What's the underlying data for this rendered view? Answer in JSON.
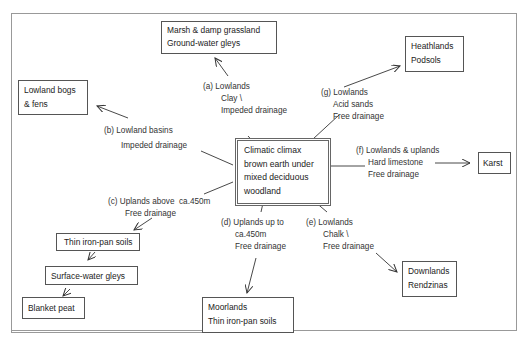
{
  "diagram": {
    "type": "soil-development flow diagram",
    "center": {
      "lines": [
        "Climatic climax",
        "brown earth under",
        "mixed deciduous",
        "woodland"
      ]
    },
    "branches": [
      {
        "id": "a",
        "marker": "(a)",
        "conditions": [
          "Lowlands",
          "Clay",
          "Impeded drainage"
        ],
        "outcomes": [
          [
            "Marsh & damp grassland",
            "Ground-water gleys"
          ]
        ]
      },
      {
        "id": "b",
        "marker": "(b)",
        "conditions": [
          "Lowland basins",
          "Impeded drainage"
        ],
        "outcomes": [
          [
            "Lowland bogs",
            "& fens"
          ]
        ]
      },
      {
        "id": "c",
        "marker": "(c)",
        "conditions": [
          "Uplands above  ca.450m",
          "Free drainage"
        ],
        "outcomes": [
          [
            "Thin iron-pan soils"
          ],
          [
            "Surface-water gleys"
          ],
          [
            "Blanket peat"
          ]
        ]
      },
      {
        "id": "d",
        "marker": "(d)",
        "conditions": [
          "Uplands up to",
          "ca.450m",
          "Free drainage"
        ],
        "outcomes": [
          [
            "Moorlands",
            "Thin iron-pan soils"
          ]
        ]
      },
      {
        "id": "e",
        "marker": "(e)",
        "conditions": [
          "Lowlands",
          "Chalk",
          "Free drainage"
        ],
        "outcomes": [
          [
            "Downlands",
            "Rendzinas"
          ]
        ]
      },
      {
        "id": "f",
        "marker": "(f)",
        "conditions": [
          "Lowlands & uplands",
          "Hard limestone",
          "Free drainage"
        ],
        "outcomes": [
          [
            "Karst"
          ]
        ]
      },
      {
        "id": "g",
        "marker": "(g)",
        "conditions": [
          "Lowlands",
          "Acid sands",
          "Free drainage"
        ],
        "outcomes": [
          [
            "Heathlands",
            "Podsols"
          ]
        ]
      }
    ]
  }
}
